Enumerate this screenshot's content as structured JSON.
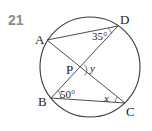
{
  "problem_number": "21",
  "points": {
    "A": {
      "label": "A",
      "x": 47,
      "y": 40
    },
    "B": {
      "label": "B",
      "x": 51,
      "y": 98
    },
    "C": {
      "label": "C",
      "x": 125,
      "y": 103
    },
    "D": {
      "label": "D",
      "x": 118,
      "y": 26
    },
    "P": {
      "label": "P",
      "x": 79,
      "y": 70
    }
  },
  "circle": {
    "cx": 90,
    "cy": 67,
    "r": 50
  },
  "segments": [
    "AD",
    "AC",
    "BD",
    "BC"
  ],
  "angles": {
    "ADB": {
      "label": "35°",
      "vertex": "D"
    },
    "DBC": {
      "label": "50°",
      "vertex": "B"
    },
    "BCA": {
      "label": "x",
      "vertex": "C"
    },
    "DPC": {
      "label": "y",
      "vertex": "P"
    }
  }
}
